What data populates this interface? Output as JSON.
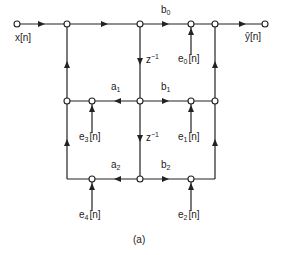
{
  "diagram": {
    "type": "signal-flow-graph",
    "caption": "(a)",
    "input_label": "x[n]",
    "output_label": "ŷ[n]",
    "coefficients": {
      "b0": {
        "base": "b",
        "sub": "0"
      },
      "b1": {
        "base": "b",
        "sub": "1"
      },
      "b2": {
        "base": "b",
        "sub": "2"
      },
      "a1": {
        "base": "a",
        "sub": "1"
      },
      "a2": {
        "base": "a",
        "sub": "2"
      }
    },
    "delays": [
      {
        "base": "z",
        "sup": "−1"
      },
      {
        "base": "z",
        "sup": "−1"
      }
    ],
    "noise_sources": {
      "e0": {
        "base": "e",
        "sub": "0",
        "arg": "[n]"
      },
      "e1": {
        "base": "e",
        "sub": "1",
        "arg": "[n]"
      },
      "e2": {
        "base": "e",
        "sub": "2",
        "arg": "[n]"
      },
      "e3": {
        "base": "e",
        "sub": "3",
        "arg": "[n]"
      },
      "e4": {
        "base": "e",
        "sub": "4",
        "arg": "[n]"
      }
    },
    "colors": {
      "line": "#222222",
      "background": "#ffffff"
    }
  }
}
